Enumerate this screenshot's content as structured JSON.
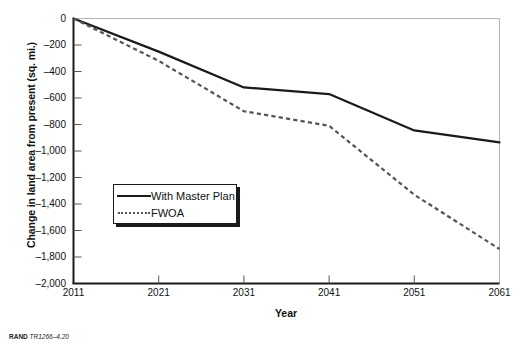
{
  "chart_data": {
    "type": "line",
    "title": "",
    "xlabel": "Year",
    "ylabel": "Change in land area from present (sq. mi.)",
    "x": [
      2011,
      2021,
      2031,
      2041,
      2051,
      2061
    ],
    "xlim": [
      2011,
      2061
    ],
    "ylim": [
      -2000,
      0
    ],
    "xticks": [
      "2011",
      "2021",
      "2031",
      "2041",
      "2051",
      "2061"
    ],
    "yticks": [
      "0",
      "–200",
      "–400",
      "–600",
      "–800",
      "–1,000",
      "–1,200",
      "–1,400",
      "–1,600",
      "–1,800",
      "–2,000"
    ],
    "ytick_values": [
      0,
      -200,
      -400,
      -600,
      -800,
      -1000,
      -1200,
      -1400,
      -1600,
      -1800,
      -2000
    ],
    "grid": false,
    "legend_position": "center-left",
    "series": [
      {
        "name": "With Master Plan",
        "style": "solid",
        "color": "#1a1a1a",
        "values": [
          0,
          -250,
          -520,
          -570,
          -845,
          -935
        ]
      },
      {
        "name": "FWOA",
        "style": "dashed",
        "color": "#555555",
        "values": [
          0,
          -320,
          -700,
          -810,
          -1330,
          -1740
        ]
      }
    ]
  },
  "legend": {
    "items": [
      {
        "label": "With Master Plan",
        "style": "solid"
      },
      {
        "label": "FWOA",
        "style": "dashed"
      }
    ]
  },
  "credit": {
    "org": "RAND",
    "document_id": "TR1266–4.20"
  }
}
